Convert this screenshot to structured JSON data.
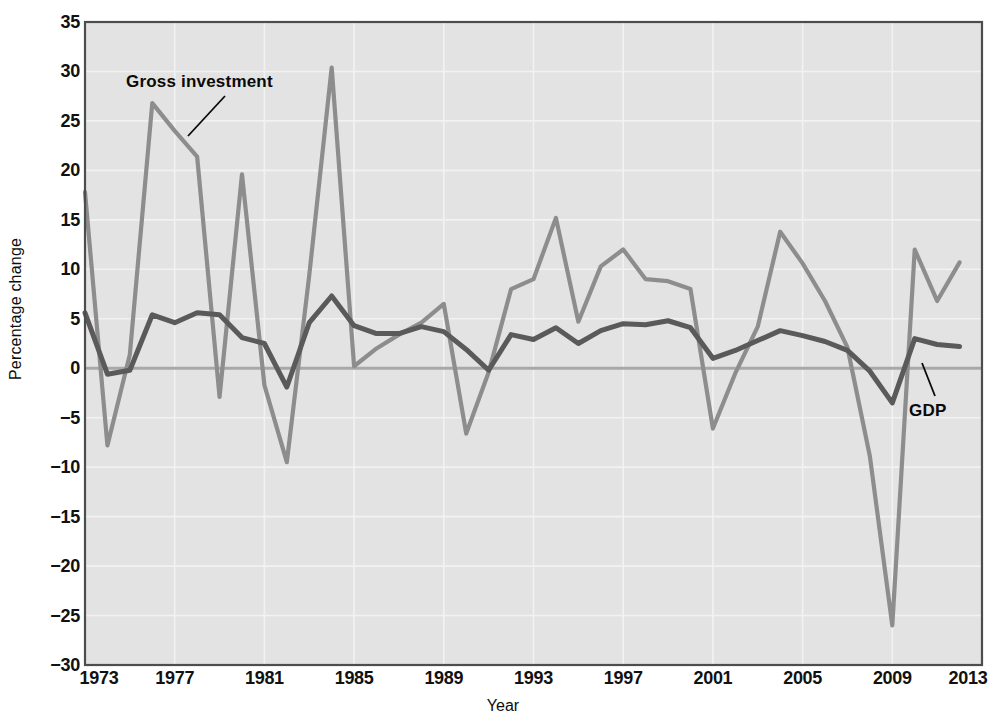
{
  "chart_data": {
    "type": "line",
    "title": "",
    "xlabel": "Year",
    "ylabel": "Percentage change",
    "xlim": [
      1973,
      2013
    ],
    "ylim": [
      -30,
      35
    ],
    "xticks": [
      1973,
      1977,
      1981,
      1985,
      1989,
      1993,
      1997,
      2001,
      2005,
      2009,
      2013
    ],
    "yticks": [
      35,
      30,
      25,
      20,
      15,
      10,
      5,
      0,
      -5,
      -10,
      -15,
      -20,
      -25,
      -30
    ],
    "ytick_labels": [
      "35",
      "30",
      "25",
      "20",
      "15",
      "10",
      "5",
      "0",
      "−5",
      "−10",
      "−15",
      "−20",
      "−25",
      "−30"
    ],
    "xtick_labels": [
      "1973",
      "1977",
      "1981",
      "1985",
      "1989",
      "1993",
      "1997",
      "2001",
      "2005",
      "2009",
      "2013"
    ],
    "grid": true,
    "legend_position": "inline-annotations",
    "x": [
      1973,
      1974,
      1975,
      1976,
      1977,
      1978,
      1979,
      1980,
      1981,
      1982,
      1983,
      1984,
      1985,
      1986,
      1987,
      1988,
      1989,
      1990,
      1991,
      1992,
      1993,
      1994,
      1995,
      1996,
      1997,
      1998,
      1999,
      2000,
      2001,
      2002,
      2003,
      2004,
      2005,
      2006,
      2007,
      2008,
      2009,
      2010,
      2011,
      2012
    ],
    "series": [
      {
        "name": "Gross investment",
        "color": "#8d8d8d",
        "values": [
          17.8,
          -7.8,
          1.4,
          26.8,
          24.0,
          21.4,
          -2.9,
          19.6,
          -1.7,
          -9.5,
          9.4,
          30.4,
          0.2,
          2.0,
          3.4,
          4.6,
          6.5,
          -6.6,
          -0.4,
          8.0,
          9.0,
          15.2,
          4.7,
          10.3,
          12.0,
          9.0,
          8.8,
          8.0,
          -6.1,
          -0.5,
          4.2,
          13.8,
          10.6,
          6.8,
          2.1,
          -8.9,
          -26.0,
          12.0,
          6.8,
          10.7
        ]
      },
      {
        "name": "GDP",
        "color": "#5a5a5a",
        "values": [
          5.6,
          -0.6,
          -0.2,
          5.4,
          4.6,
          5.6,
          5.4,
          3.1,
          2.5,
          -1.9,
          4.6,
          7.3,
          4.3,
          3.5,
          3.5,
          4.2,
          3.7,
          1.9,
          -0.2,
          3.4,
          2.9,
          4.1,
          2.5,
          3.8,
          4.5,
          4.4,
          4.8,
          4.1,
          1.0,
          1.8,
          2.8,
          3.8,
          3.3,
          2.7,
          1.8,
          -0.3,
          -3.5,
          3.0,
          2.4,
          2.2
        ]
      }
    ],
    "annotations": [
      {
        "text": "Gross investment",
        "series": "Gross investment"
      },
      {
        "text": "GDP",
        "series": "GDP"
      }
    ]
  },
  "style": {
    "plot_background": "#e3e3e3",
    "grid_color": "#f2f2f2",
    "zero_line_color": "#a8a8a8",
    "border_color": "#4d4d4d",
    "tick_text_color": "#111111"
  }
}
